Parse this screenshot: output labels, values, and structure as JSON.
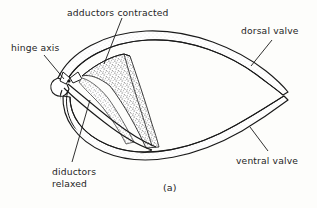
{
  "figure": {
    "panel_label": "(a)",
    "caption_labels": {
      "adductors": "adductors contracted",
      "hinge_axis": "hinge axis",
      "dorsal_valve": "dorsal valve",
      "ventral_valve": "ventral valve",
      "diductors_line1": "diductors",
      "diductors_line2": "relaxed"
    },
    "colors": {
      "ink": "#1a1a1a",
      "stipple": "#555555",
      "background": "#fdfdfb",
      "shell_fill": "#ffffff"
    },
    "structures": [
      "dorsal valve",
      "ventral valve",
      "hinge axis",
      "adductor muscles contracted",
      "diductor muscles relaxed"
    ]
  }
}
